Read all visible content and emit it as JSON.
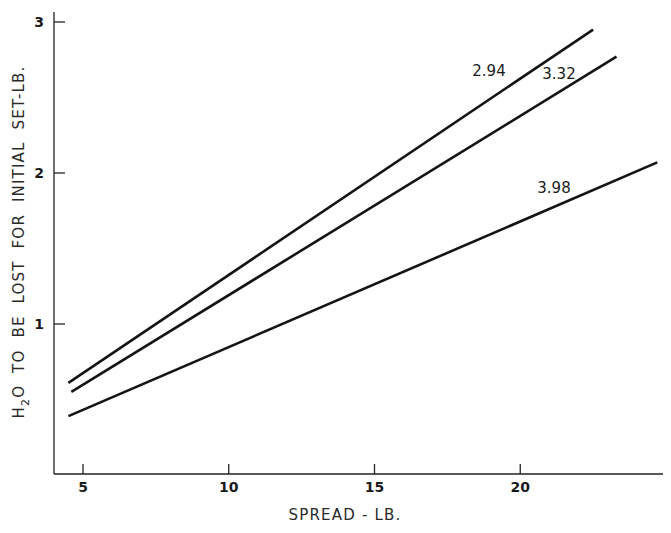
{
  "chart_data": {
    "type": "line",
    "title": "",
    "xlabel": "SPREAD - LB.",
    "ylabel": "H2O TO BE LOST FOR INITIAL SET-LB.",
    "ylabel_parts": {
      "h": "H",
      "sub": "2",
      "rest": "O  TO  BE  LOST  FOR  INITIAL  SET-LB."
    },
    "xlim": [
      4,
      25
    ],
    "ylim": [
      0,
      3.06
    ],
    "x_ticks": [
      5,
      10,
      15,
      20
    ],
    "x_tick_labels": [
      "5",
      "10",
      "15",
      "20"
    ],
    "y_ticks": [
      1,
      2,
      3
    ],
    "y_tick_labels": [
      "1",
      "2",
      "3"
    ],
    "grid": false,
    "legend": "inline labels near line ends",
    "series": [
      {
        "name": "2.94",
        "x": [
          4.5,
          22.5
        ],
        "y": [
          0.61,
          2.95
        ]
      },
      {
        "name": "3.32",
        "x": [
          4.6,
          23.3
        ],
        "y": [
          0.55,
          2.77
        ]
      },
      {
        "name": "3.98",
        "x": [
          4.5,
          24.7
        ],
        "y": [
          0.39,
          2.07
        ]
      }
    ],
    "annotations": [
      {
        "text": "2.94",
        "series": "2.94"
      },
      {
        "text": "3.32",
        "series": "3.32"
      },
      {
        "text": "3.98",
        "series": "3.98"
      }
    ]
  }
}
